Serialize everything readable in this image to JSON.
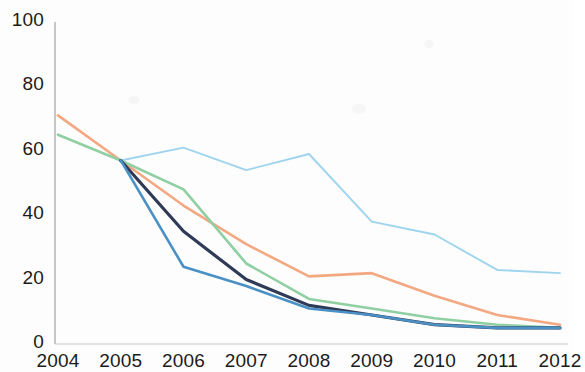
{
  "chart_data": {
    "type": "line",
    "title": "",
    "subtitle": "",
    "xlabel": "",
    "ylabel": "",
    "x": [
      2004,
      2005,
      2006,
      2007,
      2008,
      2009,
      2010,
      2011,
      2012
    ],
    "xtick_labels": [
      "2004",
      "2005",
      "2006",
      "2007",
      "2008",
      "2009",
      "2010",
      "2011",
      "2012"
    ],
    "ytick_labels": [
      "0",
      "20",
      "40",
      "60",
      "80",
      "100"
    ],
    "yticks": [
      0,
      20,
      40,
      60,
      80,
      100
    ],
    "ylim": [
      0,
      100
    ],
    "xlim": [
      2004,
      2012
    ],
    "grid": false,
    "legend": "none",
    "series": [
      {
        "name": "light-blue-series",
        "color": "#9ed4ee",
        "values": [
          null,
          57,
          61,
          54,
          59,
          38,
          34,
          23,
          22
        ]
      },
      {
        "name": "orange-series",
        "color": "#f3a882",
        "values": [
          71,
          57,
          43,
          31,
          21,
          22,
          15,
          9,
          6
        ]
      },
      {
        "name": "green-series",
        "color": "#8fcfa2",
        "values": [
          65,
          57,
          48,
          25,
          14,
          11,
          8,
          6,
          5
        ]
      },
      {
        "name": "navy-series",
        "color": "#2e3a56",
        "values": [
          null,
          57,
          35,
          20,
          12,
          9,
          6,
          5,
          5
        ]
      },
      {
        "name": "blue-series",
        "color": "#4a90c4",
        "values": [
          null,
          57,
          24,
          18,
          11,
          9,
          6,
          5,
          5
        ]
      }
    ]
  },
  "axis": {
    "y_axis_name": "y-axis",
    "x_axis_name": "x-axis"
  }
}
